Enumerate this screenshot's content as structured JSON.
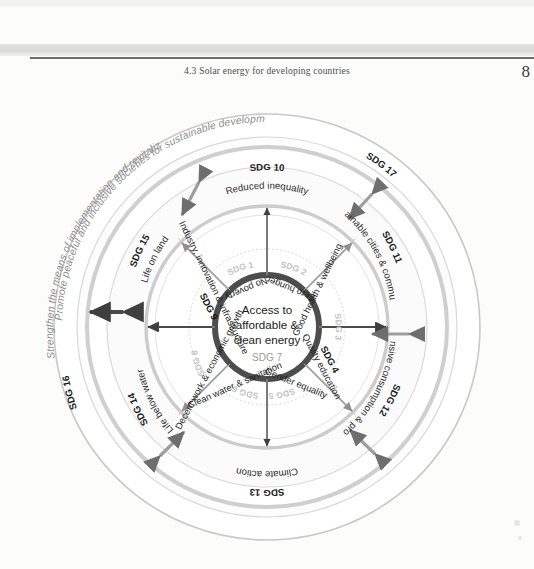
{
  "page": {
    "running_head": "4.3  Solar energy for developing countries",
    "page_number": "8"
  },
  "diagram": {
    "core": {
      "title_line1": "Access to",
      "title_line2": "affordable &",
      "title_line3": "clean energy",
      "sdg": "SDG 7"
    },
    "outer_ring": {
      "sdg16_code": "SDG 16",
      "sdg16_text": "Promote peaceful and inclusive societies for sustainable development, provide access to justice for all and build effective, accountable and inclusive institutions at all levels.",
      "sdg17_code": "SDG 17",
      "sdg17_text": "Strengthen the means of implementation and revitalize the global partnership for sustainable development (including technology, finance, capacity development, national strategies)"
    },
    "middle_ring": [
      {
        "code": "SDG 10",
        "label": "Reduced inequality"
      },
      {
        "code": "SDG 11",
        "label": "Sustainable cities & communities"
      },
      {
        "code": "SDG 12",
        "label": "Responsive consumption & production"
      },
      {
        "code": "SDG 13",
        "label": "Climate action"
      },
      {
        "code": "SDG 14",
        "label": "Life below water"
      },
      {
        "code": "SDG 15",
        "label": "Life on land"
      }
    ],
    "inner_ring": [
      {
        "code": "SDG 1",
        "label": "No poverty"
      },
      {
        "code": "SDG 2",
        "label": "Zero hunger"
      },
      {
        "code": "SDG 3",
        "label": "Good health & wellbeing"
      },
      {
        "code": "SDG 4",
        "label": "Quality education"
      },
      {
        "code": "SDG 5",
        "label": "Gender equality"
      },
      {
        "code": "SDG 6",
        "label": "Clean water & sanitation"
      },
      {
        "code": "SDG 8",
        "label": "Decent work & economic growth"
      },
      {
        "code": "SDG 9",
        "label": "Industry, innovation & infrastructure"
      }
    ],
    "colors": {
      "core_ring": "#4d4d4d",
      "ring_grey": "#c9c9c9",
      "text_dark": "#1a1a1a",
      "text_ghost": "#c3c3c3",
      "outer_italic": "#8d8d8d",
      "paper": "#fcfcfb"
    }
  }
}
